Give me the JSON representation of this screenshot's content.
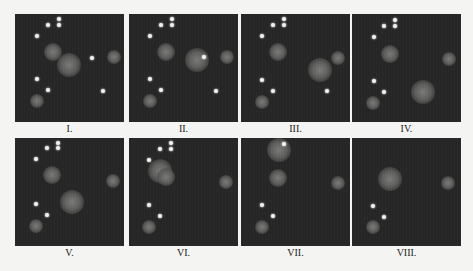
{
  "figure": {
    "panels": [
      {
        "label": "I.",
        "x": 15,
        "y": 14,
        "dots": [
          [
            44,
            5
          ],
          [
            33,
            11
          ],
          [
            44,
            11
          ],
          [
            22,
            22
          ],
          [
            77,
            44
          ],
          [
            22,
            65
          ],
          [
            33,
            76
          ],
          [
            88,
            77
          ]
        ],
        "blobs": [
          [
            38,
            38,
            9
          ],
          [
            54,
            51,
            12
          ],
          [
            99,
            43,
            7
          ],
          [
            22,
            87,
            7
          ]
        ]
      },
      {
        "label": "II.",
        "x": 129,
        "y": 14,
        "dots": [
          [
            43,
            5
          ],
          [
            32,
            11
          ],
          [
            43,
            11
          ],
          [
            21,
            22
          ],
          [
            75,
            43
          ],
          [
            21,
            65
          ],
          [
            32,
            76
          ],
          [
            87,
            77
          ]
        ],
        "blobs": [
          [
            37,
            38,
            9
          ],
          [
            68,
            46,
            12
          ],
          [
            98,
            43,
            7
          ],
          [
            21,
            87,
            7
          ]
        ]
      },
      {
        "label": "III.",
        "x": 241,
        "y": 14,
        "dots": [
          [
            43,
            5
          ],
          [
            32,
            11
          ],
          [
            43,
            11
          ],
          [
            21,
            22
          ],
          [
            21,
            66
          ],
          [
            32,
            77
          ],
          [
            86,
            77
          ]
        ],
        "blobs": [
          [
            37,
            38,
            9
          ],
          [
            79,
            56,
            12
          ],
          [
            97,
            44,
            7
          ],
          [
            21,
            88,
            7
          ]
        ]
      },
      {
        "label": "IV.",
        "x": 352,
        "y": 14,
        "dots": [
          [
            43,
            6
          ],
          [
            32,
            12
          ],
          [
            43,
            12
          ],
          [
            22,
            23
          ],
          [
            22,
            67
          ],
          [
            32,
            78
          ]
        ],
        "blobs": [
          [
            38,
            40,
            9
          ],
          [
            71,
            78,
            12
          ],
          [
            97,
            45,
            7
          ],
          [
            21,
            89,
            7
          ]
        ]
      },
      {
        "label": "V.",
        "x": 15,
        "y": 138,
        "dots": [
          [
            43,
            5
          ],
          [
            32,
            10
          ],
          [
            43,
            10
          ],
          [
            21,
            21
          ],
          [
            21,
            66
          ],
          [
            32,
            77
          ]
        ],
        "blobs": [
          [
            37,
            37,
            9
          ],
          [
            57,
            64,
            12
          ],
          [
            98,
            43,
            7
          ],
          [
            21,
            88,
            7
          ]
        ]
      },
      {
        "label": "VI.",
        "x": 129,
        "y": 138,
        "dots": [
          [
            42,
            5
          ],
          [
            31,
            11
          ],
          [
            42,
            11
          ],
          [
            20,
            22
          ],
          [
            20,
            67
          ],
          [
            31,
            78
          ]
        ],
        "blobs": [
          [
            31,
            33,
            12
          ],
          [
            37,
            39,
            9
          ],
          [
            97,
            44,
            7
          ],
          [
            20,
            89,
            7
          ]
        ]
      },
      {
        "label": "VII.",
        "x": 241,
        "y": 138,
        "dots": [
          [
            43,
            6
          ],
          [
            21,
            67
          ],
          [
            32,
            78
          ]
        ],
        "blobs": [
          [
            38,
            12,
            12
          ],
          [
            37,
            40,
            9
          ],
          [
            97,
            45,
            7
          ],
          [
            21,
            89,
            7
          ]
        ]
      },
      {
        "label": "VIII.",
        "x": 352,
        "y": 138,
        "dots": [
          [
            21,
            68
          ],
          [
            32,
            79
          ]
        ],
        "blobs": [
          [
            38,
            41,
            12
          ],
          [
            96,
            45,
            7
          ],
          [
            21,
            89,
            7
          ]
        ]
      }
    ],
    "colors": {
      "panel_bg": "#262626",
      "dot": "#f2f2ee",
      "blob": "#6a6a68",
      "page_bg": "#f4f4f2",
      "label": "#222222"
    }
  }
}
